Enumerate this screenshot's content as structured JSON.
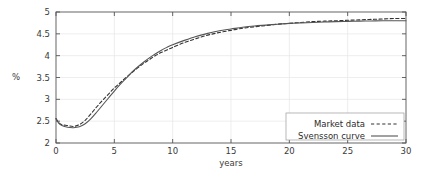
{
  "chart_data": {
    "type": "line",
    "title": "",
    "xlabel": "years",
    "ylabel": "%",
    "xlim": [
      0,
      30
    ],
    "ylim": [
      2,
      5
    ],
    "xticks": [
      "0",
      "5",
      "10",
      "15",
      "20",
      "25",
      "30"
    ],
    "xtick_values": [
      0,
      5,
      10,
      15,
      20,
      25,
      30
    ],
    "yticks": [
      "2",
      "2.5",
      "3",
      "3.5",
      "4",
      "4.5",
      "5"
    ],
    "ytick_values": [
      2,
      2.5,
      3,
      3.5,
      4,
      4.5,
      5
    ],
    "grid": true,
    "legend_position": "bottom-right",
    "background_color": "#ffffff",
    "axis_color": "#555555",
    "grid_color": "#e6e6e6",
    "series": [
      {
        "name": "Market data",
        "style": "dashed",
        "color": "#333333",
        "x": [
          0,
          0.25,
          0.5,
          1,
          1.5,
          2,
          2.5,
          3,
          3.5,
          4,
          4.5,
          5,
          5.5,
          6,
          6.5,
          7,
          7.5,
          8,
          8.5,
          9,
          9.5,
          10,
          11,
          12,
          13,
          14,
          15,
          16,
          17,
          18,
          19,
          20,
          21,
          22,
          23,
          24,
          25,
          26,
          27,
          28,
          29,
          30
        ],
        "values": [
          2.56,
          2.46,
          2.42,
          2.4,
          2.38,
          2.42,
          2.52,
          2.67,
          2.83,
          2.98,
          3.12,
          3.26,
          3.38,
          3.5,
          3.61,
          3.72,
          3.82,
          3.91,
          4.0,
          4.07,
          4.13,
          4.19,
          4.3,
          4.39,
          4.47,
          4.53,
          4.58,
          4.63,
          4.66,
          4.69,
          4.72,
          4.74,
          4.76,
          4.78,
          4.79,
          4.8,
          4.81,
          4.82,
          4.83,
          4.84,
          4.85,
          4.85
        ]
      },
      {
        "name": "Svensson curve",
        "style": "solid",
        "color": "#555555",
        "x": [
          0,
          0.25,
          0.5,
          1,
          1.5,
          2,
          2.5,
          3,
          3.5,
          4,
          4.5,
          5,
          5.5,
          6,
          6.5,
          7,
          7.5,
          8,
          8.5,
          9,
          9.5,
          10,
          11,
          12,
          13,
          14,
          15,
          16,
          17,
          18,
          19,
          20,
          21,
          22,
          23,
          24,
          25,
          26,
          27,
          28,
          29,
          30
        ],
        "values": [
          2.55,
          2.45,
          2.4,
          2.36,
          2.35,
          2.37,
          2.44,
          2.56,
          2.71,
          2.87,
          3.03,
          3.19,
          3.34,
          3.48,
          3.62,
          3.74,
          3.85,
          3.95,
          4.04,
          4.12,
          4.19,
          4.25,
          4.35,
          4.44,
          4.51,
          4.57,
          4.61,
          4.65,
          4.68,
          4.7,
          4.72,
          4.74,
          4.75,
          4.76,
          4.77,
          4.78,
          4.785,
          4.79,
          4.795,
          4.8,
          4.8,
          4.8
        ]
      }
    ],
    "legend": [
      {
        "label": "Market data",
        "style": "dashed"
      },
      {
        "label": "Svensson curve",
        "style": "solid"
      }
    ]
  }
}
